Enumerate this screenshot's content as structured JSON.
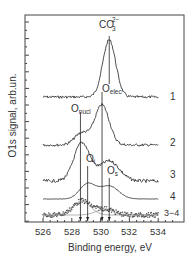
{
  "chart_data": {
    "type": "line",
    "title": "",
    "xlabel": "Binding energy, eV",
    "ylabel": "O1s signal, arb.un.",
    "xlim": [
      524.75,
      535.8
    ],
    "x_ticks": [
      526,
      528,
      530,
      532,
      534
    ],
    "x_tick_labels": [
      "526",
      "528",
      "530",
      "532",
      "534"
    ],
    "grid": false,
    "legend": "curve numbers at right end of each trace",
    "series": [
      {
        "name": "1",
        "label": "1",
        "baseline_y": 97,
        "noise": 1.3,
        "peaks": [
          {
            "center": 530.6,
            "height": 57,
            "width": 0.45
          }
        ]
      },
      {
        "name": "2",
        "label": "2",
        "baseline_y": 145,
        "noise": 1.3,
        "peaks": [
          {
            "center": 530.1,
            "height": 40,
            "width": 0.5
          },
          {
            "center": 528.7,
            "height": 12,
            "width": 0.5
          }
        ]
      },
      {
        "name": "3",
        "label": "3",
        "baseline_y": 181,
        "noise": 1.6,
        "peaks": [
          {
            "center": 528.7,
            "height": 38,
            "width": 0.55
          },
          {
            "center": 530.6,
            "height": 20,
            "width": 0.7
          }
        ]
      },
      {
        "name": "4",
        "label": "4",
        "baseline_y": 199,
        "noise": 0.2,
        "peaks": [
          {
            "center": 529.1,
            "height": 15,
            "width": 0.55
          },
          {
            "center": 530.6,
            "height": 13,
            "width": 0.65
          }
        ]
      },
      {
        "name": "3-4",
        "label": "3−4",
        "baseline_y": 215,
        "noise": 2.4,
        "style": "scatter",
        "peaks": [
          {
            "center": 528.7,
            "height": 14,
            "width": 0.6
          },
          {
            "center": 530.3,
            "height": 6,
            "width": 0.6
          }
        ]
      }
    ],
    "fit_components": [
      {
        "center": 528.7,
        "height": 14,
        "width": 0.6
      },
      {
        "center": 530.3,
        "height": 6,
        "width": 0.6
      }
    ],
    "markers": [
      {
        "name": "O_nucl",
        "energy": 528.6
      },
      {
        "name": "O_i",
        "energy": 529.1
      },
      {
        "name": "O_elec",
        "energy": 530.1
      },
      {
        "name": "O_s",
        "energy": 530.6
      }
    ],
    "peak_labels": {
      "co3": {
        "base": "CO",
        "sub": "3",
        "sup": "2−"
      },
      "o_elec": {
        "base": "O",
        "sub": "elec"
      },
      "o_nucl": {
        "base": "O",
        "sub": "nucl"
      },
      "o_i": {
        "base": "O",
        "sub": "i"
      },
      "o_s": {
        "base": "O",
        "sub": "s"
      }
    }
  }
}
